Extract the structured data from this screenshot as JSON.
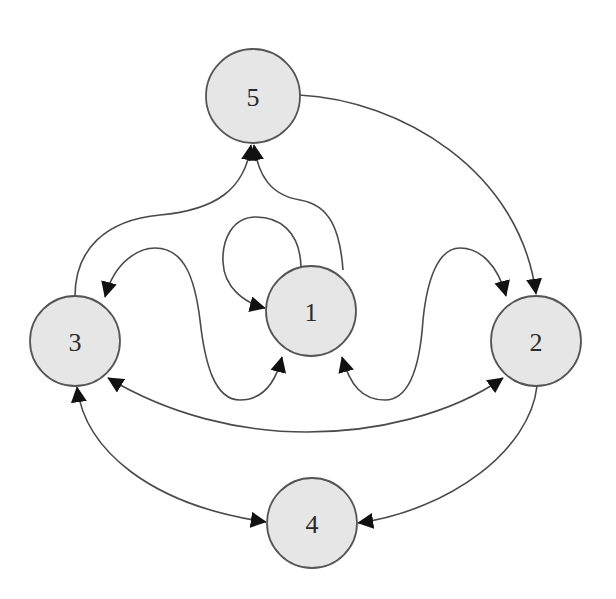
{
  "diagram": {
    "type": "directed-graph",
    "colors": {
      "node_fill": "#e6e6e6",
      "node_stroke": "#555555",
      "edge_stroke": "#4a4a4a",
      "arrow_fill": "#111111",
      "label": "#2a2a2a"
    },
    "nodes": [
      {
        "id": "1",
        "label": "1",
        "cx": 311,
        "cy": 311,
        "r": 45
      },
      {
        "id": "2",
        "label": "2",
        "cx": 536,
        "cy": 341,
        "r": 45
      },
      {
        "id": "3",
        "label": "3",
        "cx": 75,
        "cy": 341,
        "r": 45
      },
      {
        "id": "4",
        "label": "4",
        "cx": 312,
        "cy": 523,
        "r": 45
      },
      {
        "id": "5",
        "label": "5",
        "cx": 253,
        "cy": 96,
        "r": 47
      }
    ],
    "edges": [
      {
        "id": "e-1-1",
        "from": "1",
        "to": "1",
        "directed": true,
        "bidirectional": false,
        "note": "self-loop"
      },
      {
        "id": "e-1-5",
        "from": "1",
        "to": "5",
        "directed": true,
        "bidirectional": false
      },
      {
        "id": "e-3-5",
        "from": "3",
        "to": "5",
        "directed": true,
        "bidirectional": false
      },
      {
        "id": "e-5-2",
        "from": "5",
        "to": "2",
        "directed": true,
        "bidirectional": false
      },
      {
        "id": "e-3-1",
        "from": "3",
        "to": "1",
        "directed": true,
        "bidirectional": true
      },
      {
        "id": "e-1-2",
        "from": "1",
        "to": "2",
        "directed": true,
        "bidirectional": true
      },
      {
        "id": "e-3-2",
        "from": "3",
        "to": "2",
        "directed": true,
        "bidirectional": true
      },
      {
        "id": "e-3-4",
        "from": "3",
        "to": "4",
        "directed": true,
        "bidirectional": true
      },
      {
        "id": "e-2-4",
        "from": "2",
        "to": "4",
        "directed": true,
        "bidirectional": false
      }
    ]
  }
}
